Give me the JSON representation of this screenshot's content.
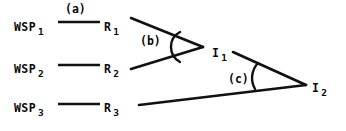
{
  "figure": {
    "type": "diagram",
    "stroke_color": "#111111",
    "background_color": "#ffffff",
    "nodes": [
      {
        "id": "wsp1",
        "base": "WSP",
        "sub": "1",
        "x": 14,
        "y": 16
      },
      {
        "id": "wsp2",
        "base": "WSP",
        "sub": "2",
        "x": 14,
        "y": 58
      },
      {
        "id": "wsp3",
        "base": "WSP",
        "sub": "3",
        "x": 14,
        "y": 97
      },
      {
        "id": "r1",
        "base": "R",
        "sub": "1",
        "x": 104,
        "y": 16
      },
      {
        "id": "r2",
        "base": "R",
        "sub": "2",
        "x": 104,
        "y": 58
      },
      {
        "id": "r3",
        "base": "R",
        "sub": "3",
        "x": 104,
        "y": 97
      },
      {
        "id": "i1",
        "base": "I",
        "sub": "1",
        "x": 212,
        "y": 42
      },
      {
        "id": "i2",
        "base": "I",
        "sub": "2",
        "x": 312,
        "y": 77
      }
    ],
    "angle_labels": [
      {
        "id": "a",
        "text": "(a)",
        "x": 65,
        "y": 4
      },
      {
        "id": "b",
        "text": "(b)",
        "x": 140,
        "y": 36
      },
      {
        "id": "c",
        "text": "(c)",
        "x": 228,
        "y": 74
      }
    ],
    "segments": [
      {
        "id": "wsp1-r1",
        "x1": 58,
        "y1": 22,
        "x2": 100,
        "y2": 22
      },
      {
        "id": "wsp2-r2",
        "x1": 58,
        "y1": 65,
        "x2": 100,
        "y2": 65
      },
      {
        "id": "wsp3-r3",
        "x1": 58,
        "y1": 104,
        "x2": 100,
        "y2": 104
      },
      {
        "id": "r1-i1",
        "x1": 131,
        "y1": 18,
        "x2": 202,
        "y2": 47
      },
      {
        "id": "r2-i1",
        "x1": 131,
        "y1": 69,
        "x2": 202,
        "y2": 47
      },
      {
        "id": "i1-i2",
        "x1": 232,
        "y1": 52,
        "x2": 305,
        "y2": 85
      },
      {
        "id": "r3-i2",
        "x1": 139,
        "y1": 104,
        "x2": 305,
        "y2": 85
      }
    ],
    "arcs": [
      {
        "id": "arc-b",
        "label_ref": "b"
      },
      {
        "id": "arc-c",
        "label_ref": "c"
      }
    ]
  }
}
